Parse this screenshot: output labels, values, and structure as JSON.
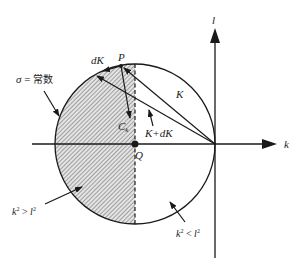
{
  "figure": {
    "axes": {
      "horizontal_label": "k",
      "vertical_label": "l"
    },
    "points": {
      "P": "P",
      "Q": "Q",
      "Ck": "C",
      "Ck_sub": "k"
    },
    "vectors": {
      "K": "K",
      "K_plus_dK": "K+dK",
      "dK": "dK"
    },
    "annotations": {
      "sigma_const_sym": "σ",
      "sigma_const_eq": " = ",
      "sigma_const_text": "常数",
      "region_left_k": "k",
      "region_left_sup1": "2",
      "region_left_op": " > ",
      "region_left_l": "l",
      "region_left_sup2": "2",
      "region_right_k": "k",
      "region_right_sup1": "2",
      "region_right_op": " < ",
      "region_right_l": "l",
      "region_right_sup2": "2"
    },
    "colors": {
      "stroke": "#1a1a1a",
      "hatch": "#555555",
      "hatch_bg": "#e6e6e6"
    }
  }
}
